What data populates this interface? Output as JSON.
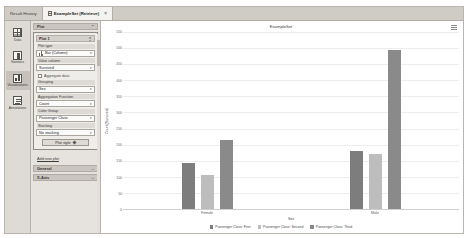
{
  "tabs": [
    {
      "label": "Result History",
      "active": false,
      "icon": null
    },
    {
      "label": "ExampleSet (Retrieve)",
      "active": true,
      "icon": "document-icon",
      "close": "×"
    }
  ],
  "rail": {
    "items": [
      {
        "label": "Data",
        "icon": "table-icon",
        "selected": false
      },
      {
        "label": "Statistics",
        "icon": "statistics-icon",
        "selected": false
      },
      {
        "label": "Visualizations",
        "icon": "chart-icon",
        "selected": true
      },
      {
        "label": "Annotations",
        "icon": "annotations-icon",
        "selected": false
      }
    ]
  },
  "config": {
    "panel_header": {
      "label": "Plot",
      "chevron": "⌃"
    },
    "plot_title": {
      "label": "Plot 1",
      "handle": "⋮"
    },
    "fields": [
      {
        "label": "Plot type",
        "value": "Bar (Column)",
        "icon": "bar-chart-icon",
        "caret": "▾"
      },
      {
        "label": "Value column",
        "value": "Survived",
        "caret": "▾"
      }
    ],
    "aggregate_checkbox": {
      "label": "Aggregate data",
      "checked": false
    },
    "fields2": [
      {
        "label": "Grouping",
        "value": "Sex",
        "caret": "▾"
      },
      {
        "label": "Aggregation Function",
        "value": "Count",
        "caret": "▾"
      },
      {
        "label": "Color Group",
        "value": "Passenger Class",
        "caret": "▾"
      },
      {
        "label": "Stacking",
        "value": "No stacking",
        "caret": "▾"
      }
    ],
    "plot_style_button": "Plot style",
    "add_new_plot": "Add new plot",
    "sections": [
      {
        "label": "General",
        "chevron": "⌄"
      },
      {
        "label": "X-Axis",
        "chevron": "⌄"
      }
    ]
  },
  "chart_data": {
    "type": "bar",
    "title": "ExampleSet",
    "xlabel": "Sex",
    "ylabel": "Count(Survived)",
    "categories": [
      "Female",
      "Male"
    ],
    "series": [
      {
        "name": "Passenger Class: First",
        "color": "#7d7d7d",
        "values": [
          144,
          179
        ]
      },
      {
        "name": "Passenger Class: Second",
        "color": "#bdbdbd",
        "values": [
          106,
          171
        ]
      },
      {
        "name": "Passenger Class: Third",
        "color": "#8a8a8a",
        "values": [
          216,
          493
        ]
      }
    ],
    "yticks": [
      550,
      500,
      450,
      400,
      350,
      300,
      250,
      200,
      150,
      100,
      50,
      0
    ],
    "ylim": [
      0,
      550
    ],
    "grid": true,
    "legend_position": "bottom",
    "menu_icon": "hamburger-icon"
  }
}
